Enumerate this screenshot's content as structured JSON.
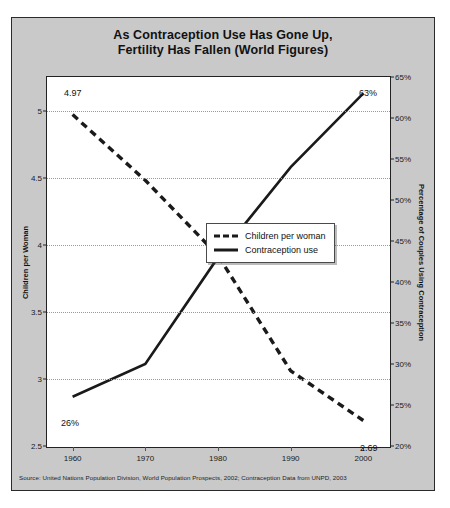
{
  "title": {
    "line1": "As Contraception Use Has Gone Up,",
    "line2": "Fertility Has Fallen (World Figures)"
  },
  "axes": {
    "left_label": "Children per Woman",
    "right_label": "Percentage of Couples Using Contraception",
    "left_ticks": [
      "5",
      "4.5",
      "4",
      "3.5",
      "3",
      "2.5"
    ],
    "right_ticks": [
      "65%",
      "60%",
      "55%",
      "50%",
      "45%",
      "40%",
      "35%",
      "30%",
      "25%",
      "20%"
    ],
    "x_ticks": [
      "1960",
      "1970",
      "1980",
      "1990",
      "2000"
    ]
  },
  "legend": {
    "items": [
      {
        "label": "Children per woman",
        "style": "dashed"
      },
      {
        "label": "Contraception use",
        "style": "solid"
      }
    ]
  },
  "annotations": {
    "fertility_start": "4.97",
    "fertility_end": "2.69",
    "contraception_start": "26%",
    "contraception_end": "63%"
  },
  "source": "Source: United Nations Population Division, World Population Prospects, 2002; Contraception Data from UNPD, 2003",
  "colors": {
    "figure_background": "#c9c9c9",
    "plot_background": "#ffffff",
    "series_line": "#1a1a1a",
    "gridline": "#9a9a9a",
    "border": "#222222"
  },
  "chart_data": {
    "type": "line",
    "title": "As Contraception Use Has Gone Up, Fertility Has Fallen (World Figures)",
    "xlabel": "",
    "x": [
      1960,
      1970,
      1980,
      1990,
      2000
    ],
    "grid": true,
    "legend_position": "center-right",
    "series": [
      {
        "name": "Children per woman",
        "style": "dashed",
        "axis": "left",
        "ylabel": "Children per Woman",
        "ylim": [
          2.5,
          5.25
        ],
        "yticks": [
          2.5,
          3,
          3.5,
          4,
          4.5,
          5
        ],
        "values": [
          4.97,
          4.48,
          3.92,
          3.06,
          2.69
        ],
        "point_labels": {
          "1960": "4.97",
          "2000": "2.69"
        }
      },
      {
        "name": "Contraception use",
        "style": "solid",
        "axis": "right",
        "ylabel": "Percentage of Couples Using Contraception",
        "ylim": [
          20,
          65
        ],
        "yticks": [
          20,
          25,
          30,
          35,
          40,
          45,
          50,
          55,
          60,
          65
        ],
        "values": [
          26,
          30,
          43,
          54,
          63
        ],
        "point_labels": {
          "1960": "26%",
          "2000": "63%"
        }
      }
    ]
  }
}
